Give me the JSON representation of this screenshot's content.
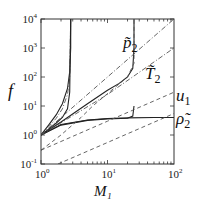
{
  "chart_data": {
    "type": "line",
    "title": "",
    "xlabel": "M₁",
    "ylabel": "f",
    "xscale": "log",
    "yscale": "log",
    "xlim": [
      1,
      100
    ],
    "ylim": [
      0.1,
      10000
    ],
    "grid": false,
    "x_ticks": [
      {
        "base": "10",
        "exp": "0"
      },
      {
        "base": "10",
        "exp": "1"
      },
      {
        "base": "10",
        "exp": "2"
      }
    ],
    "y_ticks": [
      {
        "base": "10",
        "exp": "-1"
      },
      {
        "base": "10",
        "exp": "0"
      },
      {
        "base": "10",
        "exp": "1"
      },
      {
        "base": "10",
        "exp": "2"
      },
      {
        "base": "10",
        "exp": "3"
      },
      {
        "base": "10",
        "exp": "4"
      }
    ],
    "annotations": [
      {
        "text": "p̃",
        "sub": "2",
        "x": 20,
        "y": 800
      },
      {
        "text": "T̃",
        "sub": "2",
        "x": 45,
        "y": 200
      },
      {
        "text": "u",
        "sub": "1",
        "x": 100,
        "y": 8
      },
      {
        "text": "ρ̃",
        "sub": "2",
        "x": 100,
        "y": 3.5
      }
    ],
    "series": [
      {
        "name": "p̃2 (M_crit≈2.8)",
        "style": "solid",
        "x": [
          1,
          1.3,
          1.7,
          2.1,
          2.5,
          2.7,
          2.8,
          2.8
        ],
        "y": [
          1,
          2.2,
          5,
          12,
          40,
          150,
          1000,
          10000
        ]
      },
      {
        "name": "T̃2 (M_crit≈2.8)",
        "style": "dash-dot",
        "x": [
          1,
          1.3,
          1.7,
          2.1,
          2.5,
          2.7,
          2.8
        ],
        "y": [
          1,
          1.9,
          3.8,
          8,
          25,
          100,
          10000
        ]
      },
      {
        "name": "ρ̃2 (M_crit≈2.8)",
        "style": "solid",
        "x": [
          1,
          1.3,
          1.7,
          2.1,
          2.5,
          2.7,
          2.8
        ],
        "y": [
          1,
          1.6,
          2.6,
          4,
          8,
          30,
          10000
        ]
      },
      {
        "name": "p̃2 (M_crit≈25)",
        "style": "solid",
        "x": [
          1,
          2,
          5,
          10,
          15,
          20,
          24,
          25,
          25
        ],
        "y": [
          1,
          2.8,
          12,
          35,
          60,
          100,
          200,
          1000,
          10000
        ]
      },
      {
        "name": "ρ̃2 asymptote",
        "style": "solid",
        "x": [
          1,
          2,
          5,
          10,
          20,
          24,
          25
        ],
        "y": [
          1,
          2.2,
          3.2,
          3.6,
          3.8,
          4.5,
          10
        ]
      },
      {
        "name": "ρ̃2",
        "style": "solid",
        "x": [
          1,
          2,
          5,
          10,
          20,
          50,
          100
        ],
        "y": [
          1,
          2.3,
          3.3,
          3.7,
          3.9,
          4,
          4
        ]
      },
      {
        "name": "p̃2",
        "style": "dash-dot",
        "x": [
          1,
          10,
          100
        ],
        "y": [
          1,
          100,
          10000
        ]
      },
      {
        "name": "T̃2",
        "style": "dash-dot",
        "x": [
          1,
          10,
          100
        ],
        "y": [
          1,
          25,
          1000
        ]
      },
      {
        "name": "u1 (dashed, steep)",
        "style": "dashed",
        "x": [
          1,
          2,
          4,
          6,
          20,
          25,
          25
        ],
        "y": [
          0.3,
          1,
          4,
          10,
          100,
          300,
          10000
        ]
      },
      {
        "name": "u1",
        "style": "dashed",
        "x": [
          1,
          10,
          100
        ],
        "y": [
          0.3,
          3,
          30
        ]
      },
      {
        "name": "u1 lower",
        "style": "dashed",
        "x": [
          1.8,
          10,
          100
        ],
        "y": [
          0.1,
          0.55,
          5.5
        ]
      }
    ]
  }
}
